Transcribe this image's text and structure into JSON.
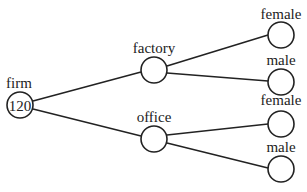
{
  "diagram": {
    "type": "tree",
    "nodes": {
      "root": {
        "label": "firm",
        "value": "120"
      },
      "factory": {
        "label": "factory",
        "value": ""
      },
      "office": {
        "label": "office",
        "value": ""
      },
      "factory_female": {
        "label": "female",
        "value": ""
      },
      "factory_male": {
        "label": "male",
        "value": ""
      },
      "office_female": {
        "label": "female",
        "value": ""
      },
      "office_male": {
        "label": "male",
        "value": ""
      }
    },
    "edges": [
      [
        "firm",
        "factory"
      ],
      [
        "firm",
        "office"
      ],
      [
        "factory",
        "female"
      ],
      [
        "factory",
        "male"
      ],
      [
        "office",
        "female"
      ],
      [
        "office",
        "male"
      ]
    ]
  }
}
